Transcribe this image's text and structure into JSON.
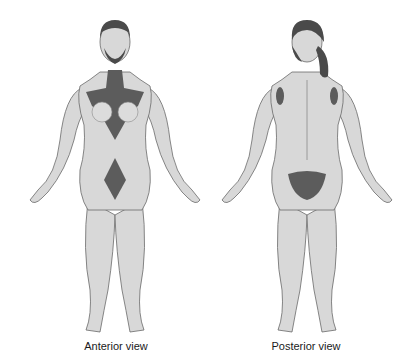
{
  "figures": [
    {
      "id": "anterior",
      "caption": "Anterior view"
    },
    {
      "id": "posterior",
      "caption": "Posterior view"
    }
  ],
  "colors": {
    "skin": "#d8d8d8",
    "skin_shadow": "#b5b5b5",
    "outline": "#6a6a6a",
    "hair": "#4a4a4a",
    "hair_region": "#5c5c5c"
  }
}
